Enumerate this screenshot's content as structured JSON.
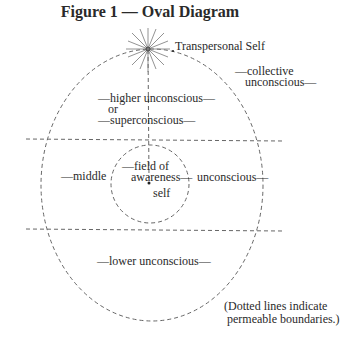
{
  "title": "Figure 1 — Oval Diagram",
  "labels": {
    "transpersonal_self": "Transpersonal Self",
    "collective_1": "—collective",
    "collective_2": "unconscious—",
    "higher_1": "—higher unconscious—",
    "higher_2": "or",
    "higher_3": "—superconscious—",
    "middle": "—middle",
    "field_1": "—field of",
    "field_2": "awareness—",
    "self": "self",
    "unconscious": "unconscious—",
    "lower": "—lower unconscious—",
    "note_1": "(Dotted lines indicate",
    "note_2": "permeable boundaries.)"
  },
  "colors": {
    "line": "#555555",
    "text": "#2a2a2a"
  }
}
